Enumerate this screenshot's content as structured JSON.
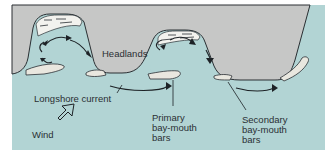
{
  "diagram": {
    "colors": {
      "land": "#c6c7c6",
      "water": "#b2d4d4",
      "outline": "#2a2f33",
      "sand": "#e9e7df",
      "background": "#ffffff"
    },
    "labels": {
      "headlands": "Headlands",
      "longshore_current": "Longshore current",
      "wind": "Wind",
      "primary_bars": "Primary\nbay-mouth\nbars",
      "secondary_bars": "Secondary\nbay-mouth\nbars"
    },
    "icons": {
      "wind_direction": "wind-arrow-icon",
      "current_arrows": "arrow-icon"
    }
  }
}
